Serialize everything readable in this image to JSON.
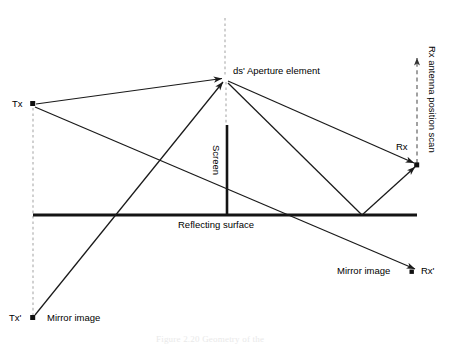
{
  "figure": {
    "type": "ray-optics-diagram",
    "caption": "Figure 2.20   Geometry of the",
    "background_color": "#ffffff",
    "line_color": "#1a1a1a",
    "dashed_color": "#b0b0b0",
    "scan_dash_color": "#555555"
  },
  "labels": {
    "tx": "Tx",
    "tx_mirror": "Tx'",
    "tx_mirror_note": "Mirror image",
    "rx": "Rx",
    "rx_mirror": "Rx'",
    "rx_mirror_note": "Mirror image",
    "aperture": "ds' Aperture element",
    "screen": "Screen",
    "reflecting_surface": "Reflecting surface",
    "scan_axis": "Rx antenna position scan"
  },
  "geometry": {
    "points": {
      "tx": {
        "x": 33,
        "y": 104
      },
      "tx_mirror": {
        "x": 33,
        "y": 318
      },
      "aperture": {
        "x": 225,
        "y": 79
      },
      "rx": {
        "x": 417,
        "y": 165
      },
      "rx_mirror": {
        "x": 415,
        "y": 272
      },
      "bounce_left": {
        "x": 117,
        "y": 215
      },
      "bounce_right": {
        "x": 362,
        "y": 215
      },
      "scan_top": {
        "x": 417,
        "y": 55
      },
      "aperture_dash_top": {
        "x": 225,
        "y": 18
      },
      "screen_top": {
        "x": 227,
        "y": 125
      },
      "screen_bottom": {
        "x": 227,
        "y": 215
      }
    },
    "reflecting_surface": {
      "x1": 33,
      "x2": 417,
      "y": 215
    },
    "rays": [
      {
        "name": "tx-to-aperture-direct",
        "from": "tx",
        "to": "aperture"
      },
      {
        "name": "tx-to-surface-bounce",
        "from": "tx",
        "to": "bounce_left"
      },
      {
        "name": "tx-mirror-to-aperture",
        "from": "tx_mirror",
        "to": "aperture"
      },
      {
        "name": "aperture-to-rx-direct",
        "from": "aperture",
        "to": "rx"
      },
      {
        "name": "aperture-to-rx-mirror",
        "from": "aperture",
        "to": "rx_mirror"
      },
      {
        "name": "surface-bounce-to-rx",
        "from": "bounce_right",
        "to": "rx"
      }
    ]
  }
}
